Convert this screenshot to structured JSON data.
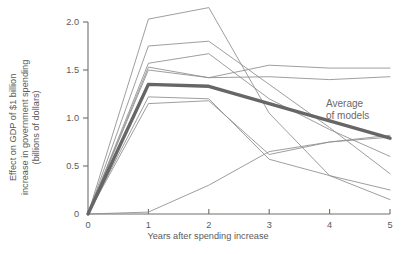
{
  "chart_data": {
    "type": "line",
    "title": "",
    "subtitle": "",
    "xlabel": "Years after spending increase",
    "ylabel": "Effect on GDP of $1 billion increase in government spending (billions of dollars)",
    "ylabel_lines": [
      "Effect on GDP of $1 billion",
      "increase in government spending",
      "(billions of dollars)"
    ],
    "x": [
      0,
      1,
      2,
      3,
      4,
      5
    ],
    "xlim": [
      0,
      5
    ],
    "ylim": [
      0,
      2.25
    ],
    "xticks": [
      "0",
      "1",
      "2",
      "3",
      "4",
      "5"
    ],
    "yticks": [
      "0",
      "0.5",
      "1.0",
      "1.5",
      "2.0"
    ],
    "ytick_values": [
      0,
      0.5,
      1.0,
      1.5,
      2.0
    ],
    "grid": false,
    "legend": "none",
    "annotations": [
      {
        "name": "average-of-models",
        "text_lines": [
          "Average",
          "of models"
        ],
        "text": "Average of models",
        "x": 4.05,
        "y": 1.26
      }
    ],
    "series": [
      {
        "name": "model-1",
        "values": [
          0,
          2.03,
          2.15,
          1.05,
          0.4,
          0.15
        ],
        "style": "thin"
      },
      {
        "name": "model-2",
        "values": [
          0,
          1.75,
          1.8,
          1.35,
          0.9,
          0.42
        ],
        "style": "thin"
      },
      {
        "name": "model-3",
        "values": [
          0,
          1.57,
          1.67,
          1.2,
          0.88,
          0.6
        ],
        "style": "thin"
      },
      {
        "name": "model-4",
        "values": [
          0,
          1.53,
          1.42,
          1.55,
          1.52,
          1.52
        ],
        "style": "thin"
      },
      {
        "name": "model-5",
        "values": [
          0,
          1.5,
          1.42,
          1.43,
          1.4,
          1.43
        ],
        "style": "thin"
      },
      {
        "name": "model-6",
        "values": [
          0,
          1.22,
          1.2,
          0.57,
          0.4,
          0.25
        ],
        "style": "thin"
      },
      {
        "name": "model-7",
        "values": [
          0,
          1.15,
          1.18,
          0.62,
          0.75,
          0.8
        ],
        "style": "thin"
      },
      {
        "name": "model-8",
        "values": [
          0,
          0.02,
          0.3,
          0.65,
          0.75,
          0.82
        ],
        "style": "thin"
      },
      {
        "name": "average-of-models",
        "values": [
          0,
          1.35,
          1.33,
          1.15,
          0.97,
          0.79
        ],
        "style": "thick"
      }
    ],
    "colors": {
      "thin_line": "#8c8c8c",
      "thick_line": "#666666",
      "axis": "#6e6e6e",
      "text": "#5a5a5a",
      "background": "#ffffff"
    }
  }
}
